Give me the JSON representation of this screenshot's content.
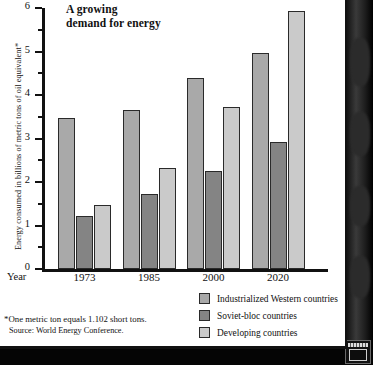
{
  "chart_data": {
    "type": "bar",
    "title": "A growing demand for energy",
    "title_line1": "A growing",
    "title_line2": "demand for energy",
    "xlabel": "Year",
    "ylabel": "Energy consumed in billions of metric tons of oil equivalent*",
    "categories": [
      "1973",
      "1985",
      "2000",
      "2020"
    ],
    "series": [
      {
        "name": "Industrialized Western countries",
        "color": "#a9a9a9",
        "values": [
          3.48,
          3.65,
          4.39,
          4.96
        ]
      },
      {
        "name": "Soviet-bloc countries",
        "color": "#848484",
        "values": [
          1.22,
          1.73,
          2.26,
          2.93
        ]
      },
      {
        "name": "Developing countries",
        "color": "#cacaca",
        "values": [
          1.48,
          2.33,
          3.72,
          5.93
        ]
      }
    ],
    "ylim": [
      0,
      6
    ],
    "ytick_labels": [
      "0",
      "1",
      "2",
      "3",
      "4",
      "5",
      "6"
    ],
    "ytick_values": [
      0,
      1,
      2,
      3,
      4,
      5,
      6
    ],
    "yminor_values": [
      0.5,
      1.5,
      2.5,
      3.5,
      4.5,
      5.5
    ],
    "grid": false,
    "legend_position": "bottom-right"
  },
  "footnotes": {
    "note": "*One metric ton equals 1.102 short tons.",
    "source": "Source: World Energy Conference."
  }
}
